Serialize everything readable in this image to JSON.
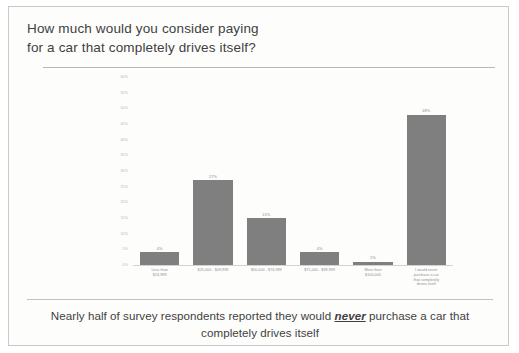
{
  "slide": {
    "title_line_1": "How much would you consider paying",
    "title_line_2": "for a car that completely drives itself?",
    "caption_before": "Nearly half of survey respondents reported they would",
    "caption_emphasis": "never",
    "caption_after": "purchase a car that completely drives itself"
  },
  "chart_data": {
    "type": "bar",
    "title": "How much would you consider paying for a car that completely drives itself?",
    "xlabel": "",
    "ylabel": "",
    "ylim": [
      0,
      60
    ],
    "grid": false,
    "legend": "none",
    "bar_color": "#7f7f7f",
    "categories": [
      "Less than $24,999",
      "$25,000 - $49,999",
      "$50,000 - $74,999",
      "$75,000 - $99,999",
      "More than $100,000",
      "I would never purchase a car that completely drives itself"
    ],
    "category_lines": [
      [
        "Less than",
        "$24,999"
      ],
      [
        "$25,000 - $49,999"
      ],
      [
        "$50,000 - $74,999"
      ],
      [
        "$75,000 - $99,999"
      ],
      [
        "More than",
        "$100,000"
      ],
      [
        "I would never",
        "purchase a car",
        "that completely",
        "drives itself"
      ]
    ],
    "values": [
      4,
      27,
      15,
      4,
      1,
      48
    ],
    "value_labels": [
      "4%",
      "27%",
      "15%",
      "4%",
      "1%",
      "48%"
    ],
    "ytick_labels": [
      "60%",
      "55%",
      "50%",
      "45%",
      "40%",
      "35%",
      "30%",
      "25%",
      "20%",
      "15%",
      "10%",
      "5%",
      "0%"
    ],
    "ytick_values": [
      60,
      55,
      50,
      45,
      40,
      35,
      30,
      25,
      20,
      15,
      10,
      5,
      0
    ]
  }
}
